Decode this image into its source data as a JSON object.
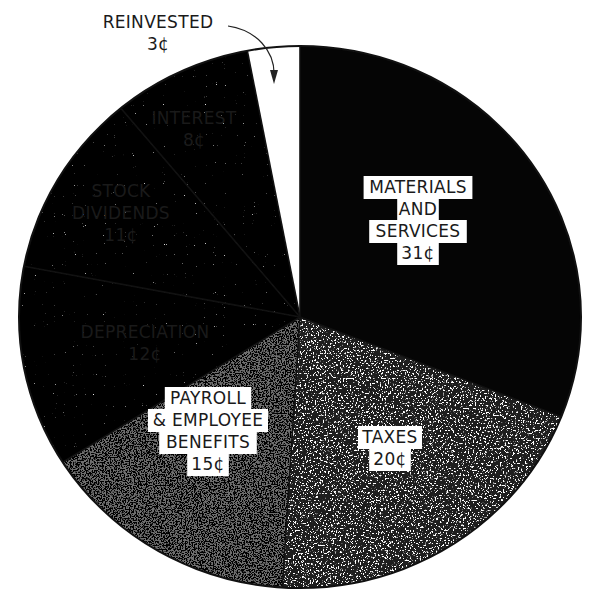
{
  "chart_data": {
    "type": "pie",
    "title": "",
    "unit": "¢",
    "categories": [
      "Materials and Services",
      "Taxes",
      "Payroll & Employee Benefits",
      "Depreciation",
      "Stock Dividends",
      "Interest",
      "Reinvested"
    ],
    "values": [
      31,
      20,
      15,
      12,
      11,
      8,
      3
    ],
    "start_angle_deg": 0,
    "direction": "clockwise",
    "fills": [
      "#050505",
      "#1e1e1e",
      "#6e6e6e",
      "#e9e9e9",
      "#f0f0f0",
      "#fafafa",
      "#ffffff"
    ],
    "legend": "none (labels inside slices)",
    "slices": [
      {
        "lines": [
          "MATERIALS",
          "AND",
          "SERVICES"
        ],
        "value_label": "31¢"
      },
      {
        "lines": [
          "TAXES"
        ],
        "value_label": "20¢"
      },
      {
        "lines": [
          "PAYROLL",
          "& EMPLOYEE",
          "BENEFITS"
        ],
        "value_label": "15¢"
      },
      {
        "lines": [
          "DEPRECIATION"
        ],
        "value_label": "12¢"
      },
      {
        "lines": [
          "STOCK",
          "DIVIDENDS"
        ],
        "value_label": "11¢"
      },
      {
        "lines": [
          "INTEREST"
        ],
        "value_label": "8¢"
      },
      {
        "lines": [
          "REINVESTED"
        ],
        "value_label": "3¢",
        "callout": "arrow"
      }
    ]
  }
}
